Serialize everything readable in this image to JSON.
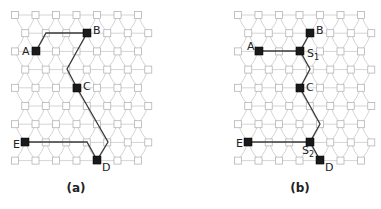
{
  "figure": {
    "panels": [
      {
        "id": "a",
        "caption": "(a)",
        "origin_x": 15,
        "nodes": [
          {
            "label": "A",
            "x": 36,
            "y": 51,
            "lx": 22,
            "ly": 55
          },
          {
            "label": "B",
            "x": 87,
            "y": 33,
            "lx": 93,
            "ly": 34
          },
          {
            "label": "C",
            "x": 77,
            "y": 88,
            "lx": 83,
            "ly": 90
          },
          {
            "label": "D",
            "x": 97,
            "y": 160,
            "lx": 102,
            "ly": 171
          },
          {
            "label": "E",
            "x": 25,
            "y": 142,
            "lx": 13,
            "ly": 148
          }
        ],
        "paths": [
          "36,51 46,33 87,33 67,69 77,88 108,142 97,160",
          "25,142 87,142 97,160"
        ],
        "caption_x": 76,
        "caption_y": 192
      },
      {
        "id": "b",
        "caption": "(b)",
        "origin_x": 238,
        "nodes": [
          {
            "label": "A",
            "x": 259,
            "y": 51,
            "lx": 247,
            "ly": 50
          },
          {
            "label": "B",
            "x": 310,
            "y": 33,
            "lx": 316,
            "ly": 34
          },
          {
            "label": "C",
            "x": 300,
            "y": 88,
            "lx": 306,
            "ly": 91
          },
          {
            "label": "D",
            "x": 320,
            "y": 160,
            "lx": 325,
            "ly": 171
          },
          {
            "label": "E",
            "x": 248,
            "y": 142,
            "lx": 236,
            "ly": 147
          },
          {
            "label": "S",
            "sub": "1",
            "x": 300,
            "y": 51,
            "lx": 307,
            "ly": 57
          },
          {
            "label": "S",
            "sub": "2",
            "x": 310,
            "y": 142,
            "lx": 302,
            "ly": 154
          }
        ],
        "paths": [
          "259,51 300,51 310,33",
          "300,51 310,69 300,88 320,124 310,142 320,160",
          "248,142 310,142"
        ],
        "caption_x": 300,
        "caption_y": 192
      }
    ],
    "grid": {
      "rows": 9,
      "cols": 7,
      "col_spacing": 20.5,
      "row_spacing": 18.2,
      "top_y": 15
    },
    "colors": {
      "grid": "#c9c9c9",
      "node_border": "#b5b5b5",
      "path": "#3a3a3a",
      "key_node": "#1a1a1a"
    }
  }
}
